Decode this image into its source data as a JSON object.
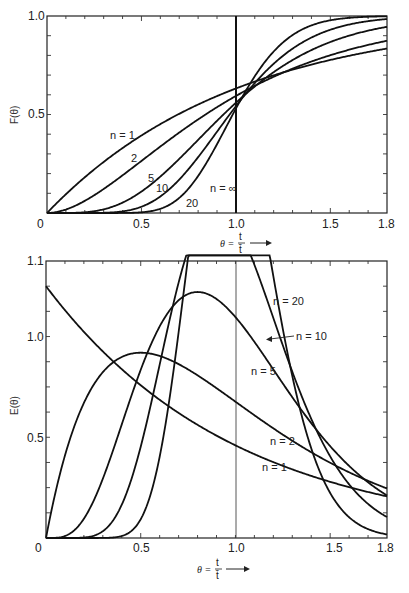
{
  "chart_data": [
    {
      "type": "line",
      "title": "",
      "xlabel": "θ = t / t̄",
      "ylabel": "F(θ)",
      "xlim": [
        0,
        1.8
      ],
      "ylim": [
        0,
        1.0
      ],
      "x_ticks": [
        "0",
        "0.5",
        "1.0",
        "1.5",
        "1.8"
      ],
      "y_ticks": [
        "0.5",
        "1.0"
      ],
      "y_zero_label": "0",
      "grid": false,
      "model": "tanks-in-series cumulative distribution F(θ)",
      "series": [
        {
          "name": "n = 1",
          "n": 1,
          "label": "n = 1",
          "label_pos": [
            0.3,
            0.37
          ],
          "sample": {
            "x": [
              0,
              0.5,
              1.0,
              1.5,
              1.8
            ],
            "y": [
              0,
              0.39,
              0.63,
              0.78,
              0.83
            ]
          }
        },
        {
          "name": "2",
          "n": 2,
          "label": "2",
          "label_pos": [
            0.34,
            0.23
          ],
          "sample": {
            "x": [
              0,
              0.5,
              1.0,
              1.5,
              1.8
            ],
            "y": [
              0,
              0.26,
              0.59,
              0.8,
              0.87
            ]
          }
        },
        {
          "name": "5",
          "n": 5,
          "label": "5",
          "label_pos": [
            0.46,
            0.14
          ],
          "sample": {
            "x": [
              0,
              0.5,
              1.0,
              1.5,
              1.8
            ],
            "y": [
              0,
              0.11,
              0.56,
              0.87,
              0.95
            ]
          }
        },
        {
          "name": "10",
          "n": 10,
          "label": "10",
          "label_pos": [
            0.52,
            0.1
          ],
          "sample": {
            "x": [
              0,
              0.5,
              1.0,
              1.5,
              1.8
            ],
            "y": [
              0,
              0.03,
              0.54,
              0.93,
              0.99
            ]
          }
        },
        {
          "name": "20",
          "n": 20,
          "label": "20",
          "label_pos": [
            0.73,
            0.04
          ],
          "sample": {
            "x": [
              0,
              0.5,
              1.0,
              1.5,
              1.8
            ],
            "y": [
              0,
              0.003,
              0.53,
              0.98,
              1.0
            ]
          }
        },
        {
          "name": "n = ∞",
          "n": "inf",
          "label": "n = ∞",
          "label_pos": [
            0.88,
            0.1
          ],
          "sample": {
            "x": [
              0,
              1.0,
              1.0,
              1.8
            ],
            "y": [
              0,
              0,
              1.0,
              1.0
            ]
          }
        }
      ]
    },
    {
      "type": "line",
      "title": "",
      "xlabel": "θ = t / t̄",
      "ylabel": "E(θ)",
      "xlim": [
        0,
        1.8
      ],
      "ylim": [
        0,
        1.1
      ],
      "x_ticks": [
        "0",
        "0.5",
        "1.0",
        "1.5",
        "1.8"
      ],
      "y_ticks": [
        "0.5",
        "1.0",
        "1.1"
      ],
      "y_zero_label": "0",
      "grid": false,
      "model": "tanks-in-series residence time distribution E(θ)",
      "series": [
        {
          "name": "n = 1",
          "n": 1,
          "label": "n = 1",
          "label_pos": [
            1.17,
            0.34
          ],
          "sample": {
            "x": [
              0,
              0.5,
              1.0,
              1.5,
              1.8
            ],
            "y": [
              1.0,
              0.61,
              0.37,
              0.22,
              0.17
            ]
          }
        },
        {
          "name": "n = 2",
          "n": 2,
          "label": "n = 2",
          "label_pos": [
            1.22,
            0.49
          ],
          "sample": {
            "x": [
              0,
              0.5,
              1.0,
              1.5,
              1.8
            ],
            "y": [
              0,
              0.74,
              0.54,
              0.3,
              0.2
            ]
          }
        },
        {
          "name": "n = 5",
          "n": 5,
          "label": "n = 5",
          "label_pos": [
            1.07,
            0.84
          ],
          "sample": {
            "x": [
              0,
              0.5,
              0.8,
              1.0,
              1.5,
              1.8
            ],
            "y": [
              0,
              0.43,
              0.98,
              0.88,
              0.24,
              0.09
            ]
          }
        },
        {
          "name": "n = 10",
          "n": 10,
          "label": "n = 10",
          "label_pos": [
            1.42,
            1.0
          ],
          "sample": {
            "x": [
              0,
              0.5,
              0.9,
              1.0,
              1.5,
              1.8
            ],
            "y": [
              0,
              0.18,
              1.32,
              1.25,
              0.17,
              0.02
            ]
          }
        },
        {
          "name": "n = 20",
          "n": 20,
          "label": "n = 20",
          "label_pos": [
            1.26,
            1.18
          ],
          "sample": {
            "x": [
              0,
              0.5,
              0.95,
              1.0,
              1.5,
              1.8
            ],
            "y": [
              0,
              0.02,
              1.77,
              1.78,
              0.08,
              0.0
            ]
          }
        }
      ]
    }
  ],
  "top_chart": {
    "ylabel": "F(θ)",
    "x_ticks": [
      "0",
      "0.5",
      "1.0",
      "1.5",
      "1.8"
    ],
    "y_ticks": [
      "0.5",
      "1.0"
    ],
    "xlabel_theta": "θ =",
    "xlabel_num": "t",
    "xlabel_den": "t̄",
    "curve_labels": [
      "n = 1",
      "2",
      "5",
      "10",
      "20",
      "n = ∞"
    ]
  },
  "bottom_chart": {
    "ylabel": "E(θ)",
    "x_ticks": [
      "0",
      "0.5",
      "1.0",
      "1.5",
      "1.8"
    ],
    "y_ticks": [
      "0.5",
      "1.0",
      "1.1"
    ],
    "xlabel_theta": "θ =",
    "xlabel_num": "t",
    "xlabel_den": "t̄",
    "curve_labels": [
      "n = 1",
      "n = 2",
      "n = 5",
      "n = 10",
      "n = 20"
    ]
  },
  "style": {
    "line_color": "#111111",
    "frame_color": "#222222",
    "background": "#ffffff"
  }
}
